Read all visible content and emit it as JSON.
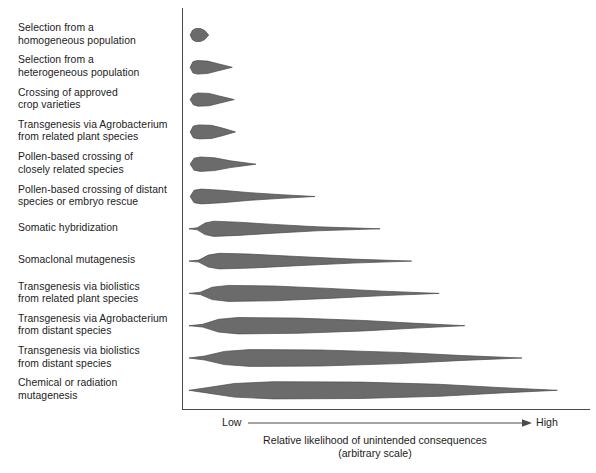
{
  "figure": {
    "name": "relative-likelihood-of-unintended-consequences",
    "fill_color": "#6b6b6b",
    "stroke_color": "#4a4a4a",
    "axis_color": "#4a4a4a"
  },
  "axis": {
    "low_label": "Low",
    "high_label": "High",
    "caption_line1": "Relative likelihood of unintended consequences",
    "caption_line2": "(arbitrary scale)"
  },
  "chart_data": {
    "type": "violin",
    "title": "",
    "xlabel": "Relative likelihood of unintended consequences (arbitrary scale)",
    "ylabel": "",
    "xlim": [
      0,
      100
    ],
    "grid": false,
    "legend": "none",
    "axis_tick_labels": [
      "Low",
      "High"
    ],
    "categories": [
      "Selection from a\nhomogeneous population",
      "Selection from a\nheterogeneous population",
      "Crossing of approved\ncrop varieties",
      "Transgenesis via Agrobacterium\nfrom related plant species",
      "Pollen-based crossing of\nclosely related species",
      "Pollen-based crossing of distant\nspecies or embryo rescue",
      "Somatic hybridization",
      "Somaclonal mutagenesis",
      "Transgenesis via biolistics\nfrom related plant species",
      "Transgenesis via Agrobacterium\nfrom distant species",
      "Transgenesis via biolistics\nfrom distant species",
      "Chemical or radiation\nmutagenesis"
    ],
    "violins": [
      {
        "category": "Selection from a homogeneous population",
        "start": 0.8,
        "peak": 2.6,
        "end": 5.5,
        "max_half_width": 6.5,
        "profile": [
          {
            "x": 0.8,
            "w": 0.0
          },
          {
            "x": 1.4,
            "w": 4.8
          },
          {
            "x": 2.2,
            "w": 6.5
          },
          {
            "x": 3.4,
            "w": 6.5
          },
          {
            "x": 4.5,
            "w": 4.6
          },
          {
            "x": 5.5,
            "w": 0.0
          }
        ]
      },
      {
        "category": "Selection from a heterogeneous population",
        "start": 0.8,
        "peak": 3.0,
        "end": 11.5,
        "max_half_width": 6.8,
        "profile": [
          {
            "x": 0.8,
            "w": 0.0
          },
          {
            "x": 1.5,
            "w": 5.6
          },
          {
            "x": 2.6,
            "w": 6.8
          },
          {
            "x": 5.2,
            "w": 6.2
          },
          {
            "x": 7.6,
            "w": 3.8
          },
          {
            "x": 11.5,
            "w": 0.0
          }
        ]
      },
      {
        "category": "Crossing of approved crop varieties",
        "start": 0.8,
        "peak": 3.4,
        "end": 12.0,
        "max_half_width": 6.6,
        "profile": [
          {
            "x": 0.8,
            "w": 0.0
          },
          {
            "x": 1.6,
            "w": 5.2
          },
          {
            "x": 2.8,
            "w": 6.6
          },
          {
            "x": 5.6,
            "w": 6.2
          },
          {
            "x": 8.2,
            "w": 3.6
          },
          {
            "x": 12.0,
            "w": 0.0
          }
        ]
      },
      {
        "category": "Transgenesis via Agrobacterium from related plant species",
        "start": 0.8,
        "peak": 4.0,
        "end": 12.3,
        "max_half_width": 7.0,
        "profile": [
          {
            "x": 0.8,
            "w": 0.0
          },
          {
            "x": 1.6,
            "w": 5.8
          },
          {
            "x": 3.0,
            "w": 7.0
          },
          {
            "x": 6.2,
            "w": 6.6
          },
          {
            "x": 9.0,
            "w": 3.8
          },
          {
            "x": 12.3,
            "w": 0.0
          }
        ]
      },
      {
        "category": "Pollen-based crossing of closely related species",
        "start": 0.8,
        "peak": 4.4,
        "end": 17.5,
        "max_half_width": 7.2,
        "profile": [
          {
            "x": 0.8,
            "w": 0.0
          },
          {
            "x": 1.8,
            "w": 6.0
          },
          {
            "x": 3.4,
            "w": 7.2
          },
          {
            "x": 7.0,
            "w": 6.4
          },
          {
            "x": 11.0,
            "w": 3.4
          },
          {
            "x": 17.5,
            "w": 0.0
          }
        ]
      },
      {
        "category": "Pollen-based crossing of distant species or embryo rescue",
        "start": 0.8,
        "peak": 5.0,
        "end": 32.5,
        "max_half_width": 7.4,
        "profile": [
          {
            "x": 0.8,
            "w": 0.0
          },
          {
            "x": 1.8,
            "w": 6.2
          },
          {
            "x": 3.6,
            "w": 7.4
          },
          {
            "x": 9.0,
            "w": 6.2
          },
          {
            "x": 16.0,
            "w": 3.8
          },
          {
            "x": 24.0,
            "w": 1.8
          },
          {
            "x": 32.5,
            "w": 0.0
          }
        ]
      },
      {
        "category": "Somatic hybridization",
        "start": 0.5,
        "peak": 7.0,
        "end": 49.0,
        "max_half_width": 7.6,
        "profile": [
          {
            "x": 0.5,
            "w": 0.0
          },
          {
            "x": 2.6,
            "w": 1.0
          },
          {
            "x": 4.6,
            "w": 5.8
          },
          {
            "x": 6.8,
            "w": 7.6
          },
          {
            "x": 13.0,
            "w": 6.6
          },
          {
            "x": 22.0,
            "w": 4.4
          },
          {
            "x": 33.0,
            "w": 2.0
          },
          {
            "x": 49.0,
            "w": 0.0
          }
        ]
      },
      {
        "category": "Somaclonal mutagenesis",
        "start": 0.5,
        "peak": 8.5,
        "end": 57.0,
        "max_half_width": 7.8,
        "profile": [
          {
            "x": 0.5,
            "w": 0.0
          },
          {
            "x": 3.0,
            "w": 1.0
          },
          {
            "x": 5.4,
            "w": 6.0
          },
          {
            "x": 8.2,
            "w": 7.8
          },
          {
            "x": 16.0,
            "w": 7.0
          },
          {
            "x": 28.0,
            "w": 4.6
          },
          {
            "x": 42.0,
            "w": 2.0
          },
          {
            "x": 57.0,
            "w": 0.0
          }
        ]
      },
      {
        "category": "Transgenesis via biolistics from related plant species",
        "start": 0.5,
        "peak": 11.0,
        "end": 64.0,
        "max_half_width": 8.0,
        "profile": [
          {
            "x": 0.5,
            "w": 0.0
          },
          {
            "x": 3.4,
            "w": 1.2
          },
          {
            "x": 6.4,
            "w": 6.2
          },
          {
            "x": 10.5,
            "w": 8.0
          },
          {
            "x": 22.0,
            "w": 7.4
          },
          {
            "x": 36.0,
            "w": 5.0
          },
          {
            "x": 50.0,
            "w": 2.2
          },
          {
            "x": 64.0,
            "w": 0.0
          }
        ]
      },
      {
        "category": "Transgenesis via Agrobacterium from distant species",
        "start": 0.5,
        "peak": 13.0,
        "end": 70.5,
        "max_half_width": 8.2,
        "profile": [
          {
            "x": 0.5,
            "w": 0.0
          },
          {
            "x": 4.0,
            "w": 1.4
          },
          {
            "x": 8.0,
            "w": 6.4
          },
          {
            "x": 13.0,
            "w": 8.2
          },
          {
            "x": 28.0,
            "w": 7.6
          },
          {
            "x": 45.0,
            "w": 5.2
          },
          {
            "x": 58.0,
            "w": 2.4
          },
          {
            "x": 70.5,
            "w": 0.0
          }
        ]
      },
      {
        "category": "Transgenesis via biolistics from distant species",
        "start": 0.5,
        "peak": 16.0,
        "end": 85.0,
        "max_half_width": 8.4,
        "profile": [
          {
            "x": 0.5,
            "w": 0.0
          },
          {
            "x": 4.5,
            "w": 2.0
          },
          {
            "x": 9.5,
            "w": 6.6
          },
          {
            "x": 16.0,
            "w": 8.4
          },
          {
            "x": 34.0,
            "w": 8.0
          },
          {
            "x": 54.0,
            "w": 5.6
          },
          {
            "x": 70.0,
            "w": 2.4
          },
          {
            "x": 85.0,
            "w": 0.0
          }
        ]
      },
      {
        "category": "Chemical or radiation mutagenesis",
        "start": 0.5,
        "peak": 22.0,
        "end": 94.0,
        "max_half_width": 8.6,
        "profile": [
          {
            "x": 0.5,
            "w": 0.0
          },
          {
            "x": 5.0,
            "w": 2.6
          },
          {
            "x": 12.0,
            "w": 6.8
          },
          {
            "x": 22.0,
            "w": 8.6
          },
          {
            "x": 44.0,
            "w": 8.2
          },
          {
            "x": 64.0,
            "w": 6.0
          },
          {
            "x": 80.0,
            "w": 2.6
          },
          {
            "x": 94.0,
            "w": 0.0
          }
        ]
      }
    ]
  }
}
